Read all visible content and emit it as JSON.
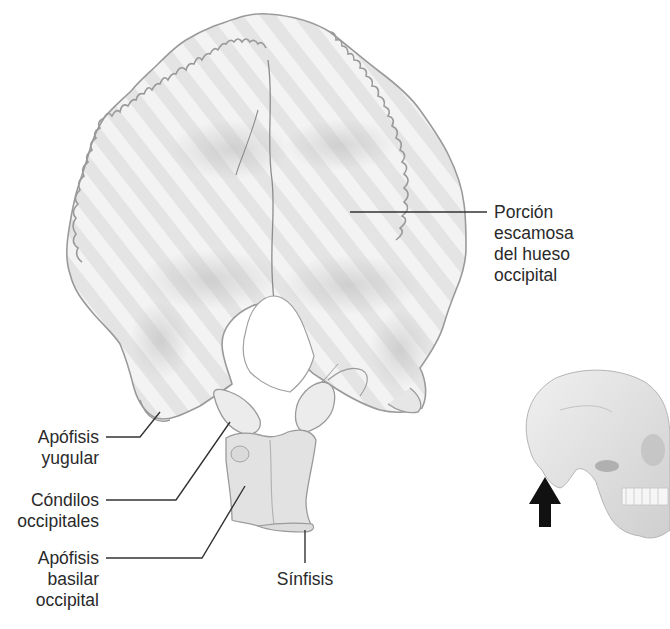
{
  "figure": {
    "title": "Hueso occipital",
    "colors": {
      "background": "#ffffff",
      "bone_fill": "#e6e6e6",
      "bone_highlight": "#f5f5f5",
      "bone_shadow": "#c8c8c8",
      "bone_outline": "#9a9a9a",
      "leader_line": "#333333",
      "label_text": "#2a2a2a",
      "arrow": "#111111"
    }
  },
  "labels": {
    "porcion_escamosa": {
      "lines": [
        "Porción",
        "escamosa",
        "del hueso",
        "occipital"
      ]
    },
    "apofisis_yugular": {
      "lines": [
        "Apófisis",
        "yugular"
      ]
    },
    "condilos_occipitales": {
      "lines": [
        "Cóndilos",
        "occipitales"
      ]
    },
    "apofisis_basilar": {
      "lines": [
        "Apófisis",
        "basilar",
        "occipital"
      ]
    },
    "sinfisis": {
      "lines": [
        "Sínfisis"
      ]
    }
  },
  "inset": {
    "description": "Vista lateral del cráneo con flecha indicando la dirección de visión",
    "arrow_direction": "up"
  }
}
